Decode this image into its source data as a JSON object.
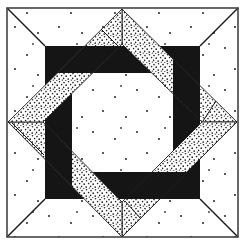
{
  "figure": {
    "kind": "quilt-block-illustration"
  },
  "colors": {
    "background": "#ffffff",
    "ink": "#1a1a1a",
    "frame": "#151515",
    "speckle_dot": "#222222",
    "sparse_dot": "#333333",
    "border": "#444444"
  },
  "pieces": {
    "frame_bars": [
      "top",
      "right",
      "bottom",
      "left"
    ],
    "bands": [
      {
        "id": "top-to-right",
        "over": "top",
        "under": "right"
      },
      {
        "id": "right-to-bottom",
        "over": "right",
        "under": "bottom"
      },
      {
        "id": "bottom-to-left",
        "over": "bottom",
        "under": "left"
      },
      {
        "id": "left-to-top",
        "over": "left",
        "under": "top"
      }
    ]
  }
}
